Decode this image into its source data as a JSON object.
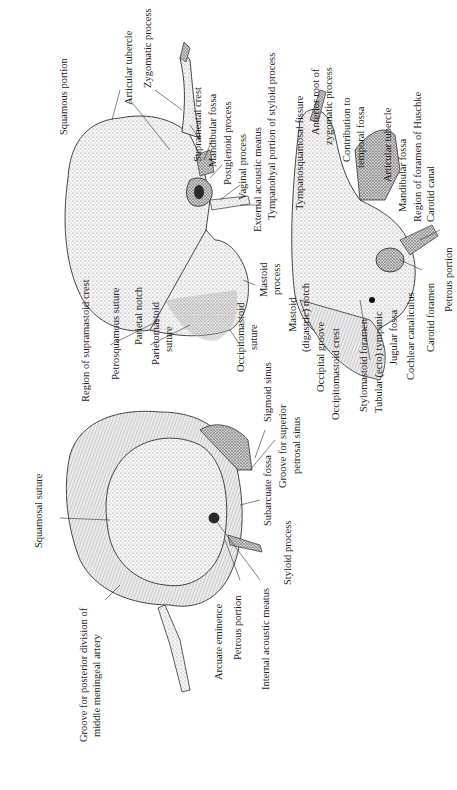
{
  "figure": {
    "orientation": "rotated-90-ccw",
    "views": [
      {
        "name": "lateral-view",
        "description": "Temporal bone, lateral surface"
      },
      {
        "name": "medial-view",
        "description": "Temporal bone, medial (internal) surface"
      },
      {
        "name": "inferior-view",
        "description": "Temporal bone, inferior surface"
      }
    ],
    "labels": {
      "squamous_portion": "Squamous portion",
      "articular_tubercle_1": "Articular tubercle",
      "zygomatic_process": "Zygomatic process",
      "suprameatal_crest": "Suprameatal crest",
      "mandibular_fossa_1": "Mandibular fossa",
      "postglenoid_process": "Postglenoid process",
      "vaginal_process": "Vaginal process",
      "external_acoustic_meatus": "External acoustic meatus",
      "tympanohyal_portion": "Tympanohyal portion of styloid process",
      "tympanosquamosal_fissure": "Tympanosquamosal fissure",
      "anterior_root_1": "Anterior root of",
      "anterior_root_2": "zygomatic process",
      "contribution_1": "Contribution to",
      "contribution_2": "temporal fossa",
      "articular_tubercle_2": "Articular tubercle",
      "mandibular_fossa_2": "Mandibular fossa",
      "foramen_huschke": "Region of foramen of Huschke",
      "carotid_canal": "Carotid canal",
      "petrous_portion_2": "Petrous portion",
      "carotid_foramen": "Carotid foramen",
      "cochlear_canaliculus": "Cochlear canaliculus",
      "jugular_fossa": "Jugular fossa",
      "tubular_tympanic": "Tubular (ecto) tympanic",
      "stylomastoid_foramen": "Stylomastoid foramen",
      "occipitomastoid_crest": "Occipitomastoid crest",
      "occipital_groove": "Occipital groove",
      "mastoid_notch_1": "Mastoid",
      "mastoid_notch_2": "(digastric) notch",
      "mastoid_process_1": "Mastoid",
      "mastoid_process_2": "process",
      "occipitomastoid_suture_1": "Occipitomastoid",
      "occipitomastoid_suture_2": "suture",
      "parietomastoid_suture_1": "Parietomastoid",
      "parietomastoid_suture_2": "suture",
      "parietal_notch": "Parietal notch",
      "petrosquamous_suture": "Petrosquamous suture",
      "supramastoid_crest": "Region of supramastoid crest",
      "sigmoid_sinus": "Sigmoid sinus",
      "groove_sps_1": "Groove for superior",
      "groove_sps_2": "petrosal sinus",
      "subarcuate_fossa": "Subarcuate fossa",
      "styloid_process": "Styloid process",
      "internal_acoustic_meatus": "Internal acoustic meatus",
      "petrous_portion_1": "Petrous portion",
      "arcuate_eminence": "Arcuate eminence",
      "squamosal_suture": "Squamosal suture",
      "groove_mma_1": "Groove for posterior division of",
      "groove_mma_2": "middle meningeal artery"
    }
  }
}
